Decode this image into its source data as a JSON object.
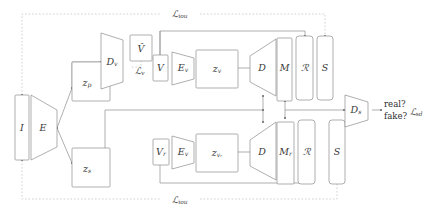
{
  "figure": {
    "background_color": "#ffffff",
    "stroke_color": "#8c8c8c",
    "dotted_color": "#bdbdbd",
    "text_color": "#3a3a3a"
  },
  "nodes": {
    "input_image": "I",
    "encoder": "E",
    "latent_pose": "z",
    "latent_pose_sub": "p",
    "latent_style": "z",
    "latent_style_sub": "s",
    "view_decoder": "D",
    "view_decoder_sub": "v",
    "view_pred": "V̂",
    "view_gt": "V",
    "view_encoder_top": "E",
    "view_encoder_top_sub": "v",
    "latent_view_top": "z",
    "latent_view_top_sub": "v",
    "decoder_top": "D",
    "mask_top": "M",
    "render_top": "ℛ",
    "silhouette_top": "S",
    "view_rand": "V",
    "view_rand_sub": "r",
    "view_encoder_bot": "E",
    "view_encoder_bot_sub": "v",
    "latent_view_bot": "z",
    "latent_view_bot_sub": "vᵣ",
    "decoder_bot": "D",
    "mask_bot": "M",
    "mask_bot_sub": "r",
    "render_bot": "ℛ",
    "silhouette_bot": "S",
    "shape_discriminator": "D",
    "shape_discriminator_sub": "s"
  },
  "losses": {
    "iou_top": "ℒ",
    "iou_top_sub": "iou",
    "iou_bottom": "ℒ",
    "iou_bottom_sub": "iou",
    "view": "ℒ",
    "view_sub": "v",
    "shape_disc": "ℒ",
    "shape_disc_sub": "sd"
  },
  "outputs": {
    "real_label": "real?",
    "fake_label": "fake?"
  }
}
